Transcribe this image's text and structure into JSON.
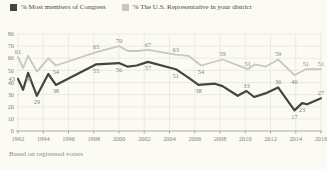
{
  "legend": [
    {
      "label": "% Most members of Congress",
      "color": "#454540"
    },
    {
      "label": "% The U.S. Representative in your district",
      "color": "#c8c8c1"
    }
  ],
  "footnote": "Based on registered voters",
  "chart_data": {
    "type": "line",
    "title": "",
    "xlabel": "",
    "ylabel": "",
    "x_axis": {
      "ticks": [
        1992,
        1994,
        1996,
        1998,
        2000,
        2002,
        2004,
        2006,
        2008,
        2010,
        2012,
        2014,
        2016
      ],
      "range": [
        1992,
        2016
      ]
    },
    "y_axis": {
      "ticks": [
        0,
        10,
        20,
        30,
        40,
        50,
        60,
        70,
        80
      ],
      "range": [
        0,
        80
      ]
    },
    "grid": true,
    "legend_position": "top",
    "series": [
      {
        "name": "% The U.S. Representative in your district",
        "color": "#c8c8c1",
        "label_color": "#9d9d93",
        "stroke_width": 1.8,
        "points": [
          {
            "x": 1992.0,
            "v": 61,
            "label": "61",
            "pos": "above"
          },
          {
            "x": 1992.4,
            "v": 52
          },
          {
            "x": 1992.8,
            "v": 62
          },
          {
            "x": 1993.5,
            "v": 49
          },
          {
            "x": 1994.4,
            "v": 60
          },
          {
            "x": 1995.0,
            "v": 54,
            "label": "54",
            "pos": "below"
          },
          {
            "x": 1998.2,
            "v": 65,
            "label": "65",
            "pos": "above"
          },
          {
            "x": 2000.0,
            "v": 70,
            "label": "70",
            "pos": "above"
          },
          {
            "x": 2000.7,
            "v": 66
          },
          {
            "x": 2001.5,
            "v": 66
          },
          {
            "x": 2002.3,
            "v": 67,
            "label": "67",
            "pos": "above"
          },
          {
            "x": 2004.5,
            "v": 63,
            "label": "63",
            "pos": "above"
          },
          {
            "x": 2005.5,
            "v": 62
          },
          {
            "x": 2006.5,
            "v": 54,
            "label": "54",
            "pos": "below"
          },
          {
            "x": 2008.2,
            "v": 59,
            "label": "59",
            "pos": "above"
          },
          {
            "x": 2010.2,
            "v": 51,
            "label": "51",
            "pos": "above"
          },
          {
            "x": 2010.8,
            "v": 55
          },
          {
            "x": 2011.6,
            "v": 53
          },
          {
            "x": 2012.6,
            "v": 59,
            "label": "59",
            "pos": "above"
          },
          {
            "x": 2013.9,
            "v": 46,
            "label": "46",
            "pos": "below"
          },
          {
            "x": 2014.8,
            "v": 51,
            "label": "51",
            "pos": "above"
          },
          {
            "x": 2016.0,
            "v": 51,
            "label": "51",
            "pos": "above"
          }
        ]
      },
      {
        "name": "% Most members of Congress",
        "color": "#454540",
        "label_color": "#55554f",
        "stroke_width": 2.2,
        "points": [
          {
            "x": 1992.0,
            "v": 43,
            "label": "43",
            "pos": "left"
          },
          {
            "x": 1992.4,
            "v": 34
          },
          {
            "x": 1992.8,
            "v": 48,
            "label": "48",
            "pos": "below"
          },
          {
            "x": 1993.5,
            "v": 29,
            "label": "29",
            "pos": "below"
          },
          {
            "x": 1994.4,
            "v": 47
          },
          {
            "x": 1995.0,
            "v": 38,
            "label": "38",
            "pos": "below"
          },
          {
            "x": 1998.2,
            "v": 55,
            "label": "55",
            "pos": "below"
          },
          {
            "x": 2000.0,
            "v": 56,
            "label": "56",
            "pos": "below"
          },
          {
            "x": 2000.7,
            "v": 53
          },
          {
            "x": 2001.4,
            "v": 54
          },
          {
            "x": 2002.3,
            "v": 57,
            "label": "57",
            "pos": "below"
          },
          {
            "x": 2004.5,
            "v": 51,
            "label": "51",
            "pos": "below"
          },
          {
            "x": 2005.5,
            "v": 44
          },
          {
            "x": 2006.3,
            "v": 38,
            "label": "38",
            "pos": "below"
          },
          {
            "x": 2007.6,
            "v": 39
          },
          {
            "x": 2008.2,
            "v": 37
          },
          {
            "x": 2009.4,
            "v": 29
          },
          {
            "x": 2010.1,
            "v": 33,
            "label": "33",
            "pos": "above"
          },
          {
            "x": 2010.7,
            "v": 28
          },
          {
            "x": 2011.6,
            "v": 31
          },
          {
            "x": 2012.6,
            "v": 36,
            "label": "36",
            "pos": "above"
          },
          {
            "x": 2013.9,
            "v": 17,
            "label": "17",
            "pos": "below"
          },
          {
            "x": 2014.5,
            "v": 23,
            "label": "23",
            "pos": "below"
          },
          {
            "x": 2014.9,
            "v": 22
          },
          {
            "x": 2016.0,
            "v": 27,
            "label": "27",
            "pos": "above"
          }
        ]
      }
    ]
  }
}
